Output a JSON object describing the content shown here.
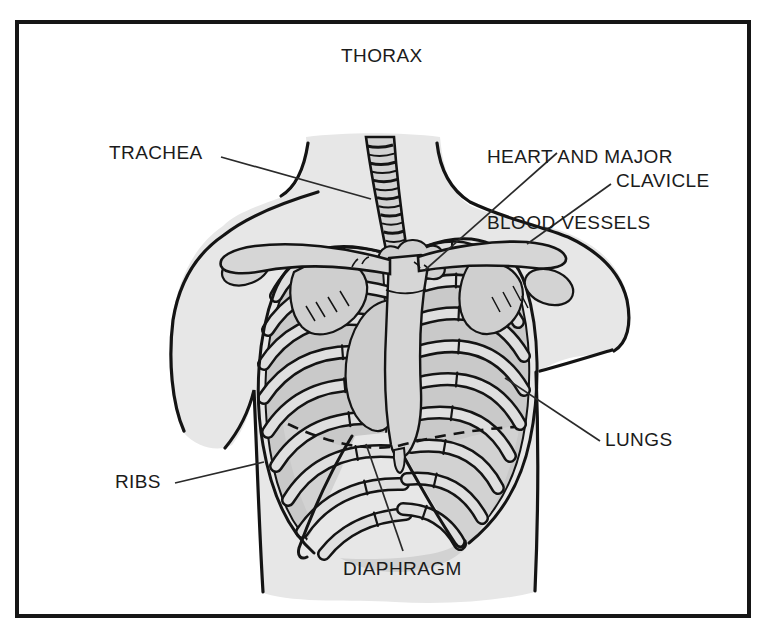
{
  "diagram": {
    "title": "THORAX",
    "labels": {
      "trachea": "TRACHEA",
      "heart_line1": "HEART AND MAJOR",
      "heart_line2": "BLOOD VESSELS",
      "clavicle": "CLAVICLE",
      "lungs": "LUNGS",
      "ribs": "RIBS",
      "diaphragm": "DIAPHRAGM"
    },
    "colors": {
      "background": "#ffffff",
      "frame_line": "#161616",
      "body_fill": "#e7e7e7",
      "cavity_fill": "#c9c9c9",
      "rib_fill": "#dfdfdf",
      "bone_fill": "#d6d6d6",
      "under_rib_fill": "#d2d2d2",
      "outline": "#141414",
      "label_text": "#1b1b1b",
      "leader_line": "#2a2a2a"
    }
  }
}
